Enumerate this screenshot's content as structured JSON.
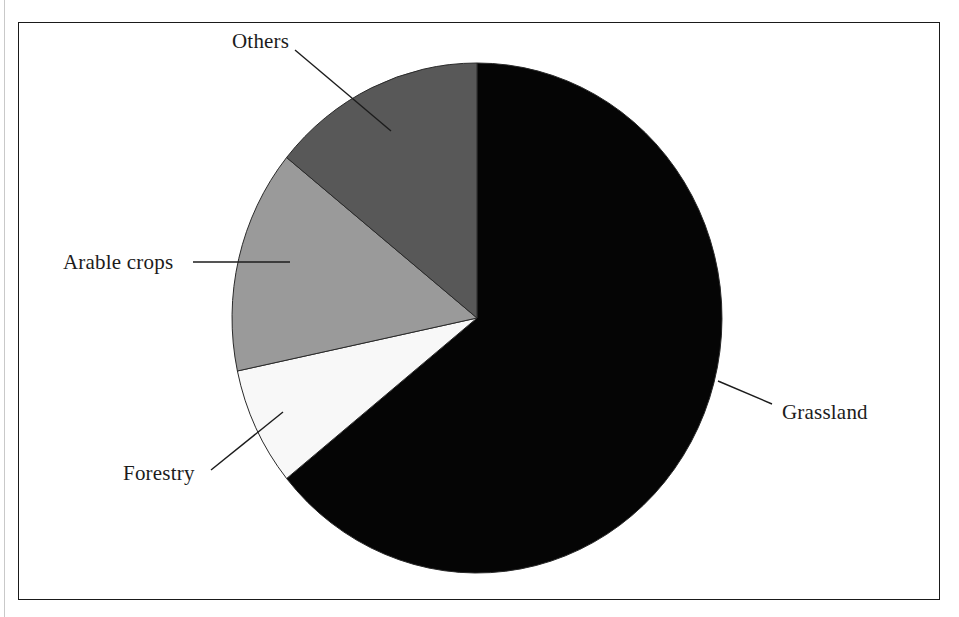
{
  "figure": {
    "frame_color": "#1a1a1a",
    "background": "#ffffff"
  },
  "labels": {
    "others": "Others",
    "arable_crops": "Arable crops",
    "forestry": "Forestry",
    "grassland": "Grassland"
  },
  "chart_data": {
    "type": "pie",
    "title": "",
    "subtitle": "",
    "xlabel": "",
    "ylabel": "",
    "legend_position": "none",
    "labels_style": "external leader lines",
    "start_angle_deg": 0,
    "direction": "clockwise",
    "center": {
      "x": 477,
      "y": 318
    },
    "radius": {
      "rx": 245,
      "ry": 255
    },
    "categories": [
      "Grassland",
      "Forestry",
      "Arable crops",
      "Others"
    ],
    "values": [
      64.2,
      7.5,
      14.1,
      14.2
    ],
    "value_unit": "percent of land area",
    "colors": [
      "#050505",
      "#f8f8f8",
      "#9a9a9a",
      "#585858"
    ],
    "slices": [
      {
        "name": "Grassland",
        "value": 64.2,
        "color": "#050505",
        "start_angle_deg": 0,
        "end_angle_deg": 231,
        "label": "Grassland",
        "leader_line": {
          "x1": 718,
          "y1": 381,
          "x2": 772,
          "y2": 404
        }
      },
      {
        "name": "Forestry",
        "value": 7.5,
        "color": "#f8f8f8",
        "start_angle_deg": 231,
        "end_angle_deg": 258,
        "label": "Forestry",
        "leader_line": {
          "x1": 211,
          "y1": 470,
          "x2": 283,
          "y2": 412
        }
      },
      {
        "name": "Arable crops",
        "value": 14.1,
        "color": "#9a9a9a",
        "start_angle_deg": 258,
        "end_angle_deg": 309,
        "label": "Arable crops",
        "leader_line": {
          "x1": 193,
          "y1": 262,
          "x2": 290,
          "y2": 262
        }
      },
      {
        "name": "Others",
        "value": 14.2,
        "color": "#585858",
        "start_angle_deg": 309,
        "end_angle_deg": 360,
        "label": "Others",
        "leader_line": {
          "x1": 295,
          "y1": 50,
          "x2": 391,
          "y2": 131
        }
      }
    ]
  }
}
